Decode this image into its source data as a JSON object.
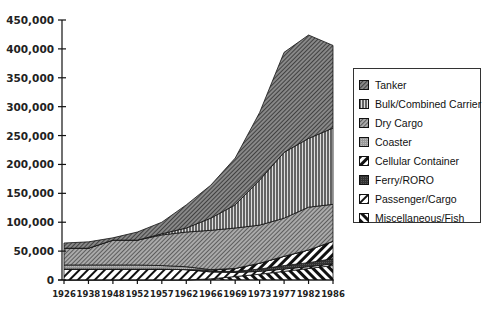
{
  "chart_data": {
    "type": "area",
    "stacked": true,
    "title": "",
    "xlabel": "",
    "ylabel": "",
    "ylim": [
      0,
      450000
    ],
    "yticks": [
      "0",
      "50,000",
      "100,000",
      "150,000",
      "200,000",
      "250,000",
      "300,000",
      "350,000",
      "400,000",
      "450,000"
    ],
    "categories": [
      "1926",
      "1938",
      "1948",
      "1952",
      "1957",
      "1962",
      "1966",
      "1969",
      "1973",
      "1977",
      "1982",
      "1986"
    ],
    "legend_position": "right",
    "grid": false,
    "series": [
      {
        "name": "Miscellaneous/Fish",
        "values": [
          0,
          0,
          0,
          0,
          0,
          0,
          2000,
          6000,
          10000,
          15000,
          20000,
          25000
        ]
      },
      {
        "name": "Passenger/Cargo",
        "values": [
          19000,
          19000,
          19000,
          19000,
          19000,
          18000,
          12000,
          7000,
          5000,
          4000,
          3000,
          3000
        ]
      },
      {
        "name": "Ferry/RORO",
        "values": [
          0,
          0,
          0,
          0,
          0,
          0,
          1000,
          2000,
          4000,
          6000,
          7000,
          9000
        ]
      },
      {
        "name": "Cellular Container",
        "values": [
          0,
          0,
          0,
          0,
          0,
          0,
          2000,
          5000,
          10000,
          16000,
          22000,
          30000
        ]
      },
      {
        "name": "Coaster",
        "values": [
          7000,
          7000,
          7000,
          7000,
          6000,
          5000,
          1000,
          0,
          0,
          0,
          0,
          0
        ]
      },
      {
        "name": "Dry Cargo",
        "values": [
          29000,
          29000,
          43000,
          43000,
          53000,
          60000,
          68000,
          70000,
          66000,
          66000,
          74000,
          64000
        ]
      },
      {
        "name": "Bulk/Combined Carrier",
        "values": [
          0,
          0,
          0,
          0,
          2000,
          7000,
          21000,
          40000,
          78000,
          114000,
          119000,
          132000
        ]
      },
      {
        "name": "Tanker",
        "values": [
          9000,
          11000,
          4000,
          14000,
          20000,
          40000,
          57000,
          81000,
          117000,
          173000,
          179000,
          143000
        ]
      }
    ],
    "totals": [
      64000,
      66000,
      73000,
      83000,
      100000,
      130000,
      164000,
      211000,
      290000,
      394000,
      424000,
      406000
    ]
  },
  "legend": {
    "items": [
      {
        "label": "Tanker",
        "pattern": "tanker"
      },
      {
        "label": "Bulk/Combined  Carrier",
        "pattern": "bulk"
      },
      {
        "label": "Dry Cargo",
        "pattern": "dry"
      },
      {
        "label": "Coaster",
        "pattern": "coaster"
      },
      {
        "label": "Cellular  Container",
        "pattern": "cellular"
      },
      {
        "label": "Ferry/RORO",
        "pattern": "ferry"
      },
      {
        "label": "Passenger/Cargo",
        "pattern": "passenger"
      },
      {
        "label": "Miscellaneous/Fish",
        "pattern": "misc"
      }
    ]
  }
}
